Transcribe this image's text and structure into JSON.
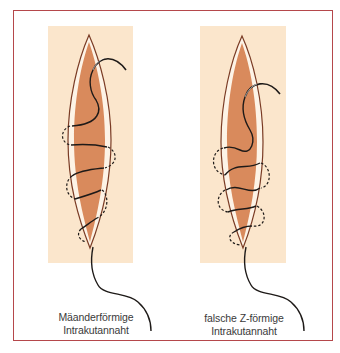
{
  "figure": {
    "colors": {
      "frame_border": "#b5474b",
      "panel_background": "#fbe6cc",
      "wound_fill": "#d98a5c",
      "wound_edge": "#7a3b24",
      "thread": "#1e1a18"
    },
    "panels": [
      {
        "id": "left",
        "caption_line1": "Mäanderförmige",
        "caption_line2": "Intrakutannaht"
      },
      {
        "id": "right",
        "caption_line1": "falsche Z-förmige",
        "caption_line2": "Intrakutannaht"
      }
    ]
  }
}
